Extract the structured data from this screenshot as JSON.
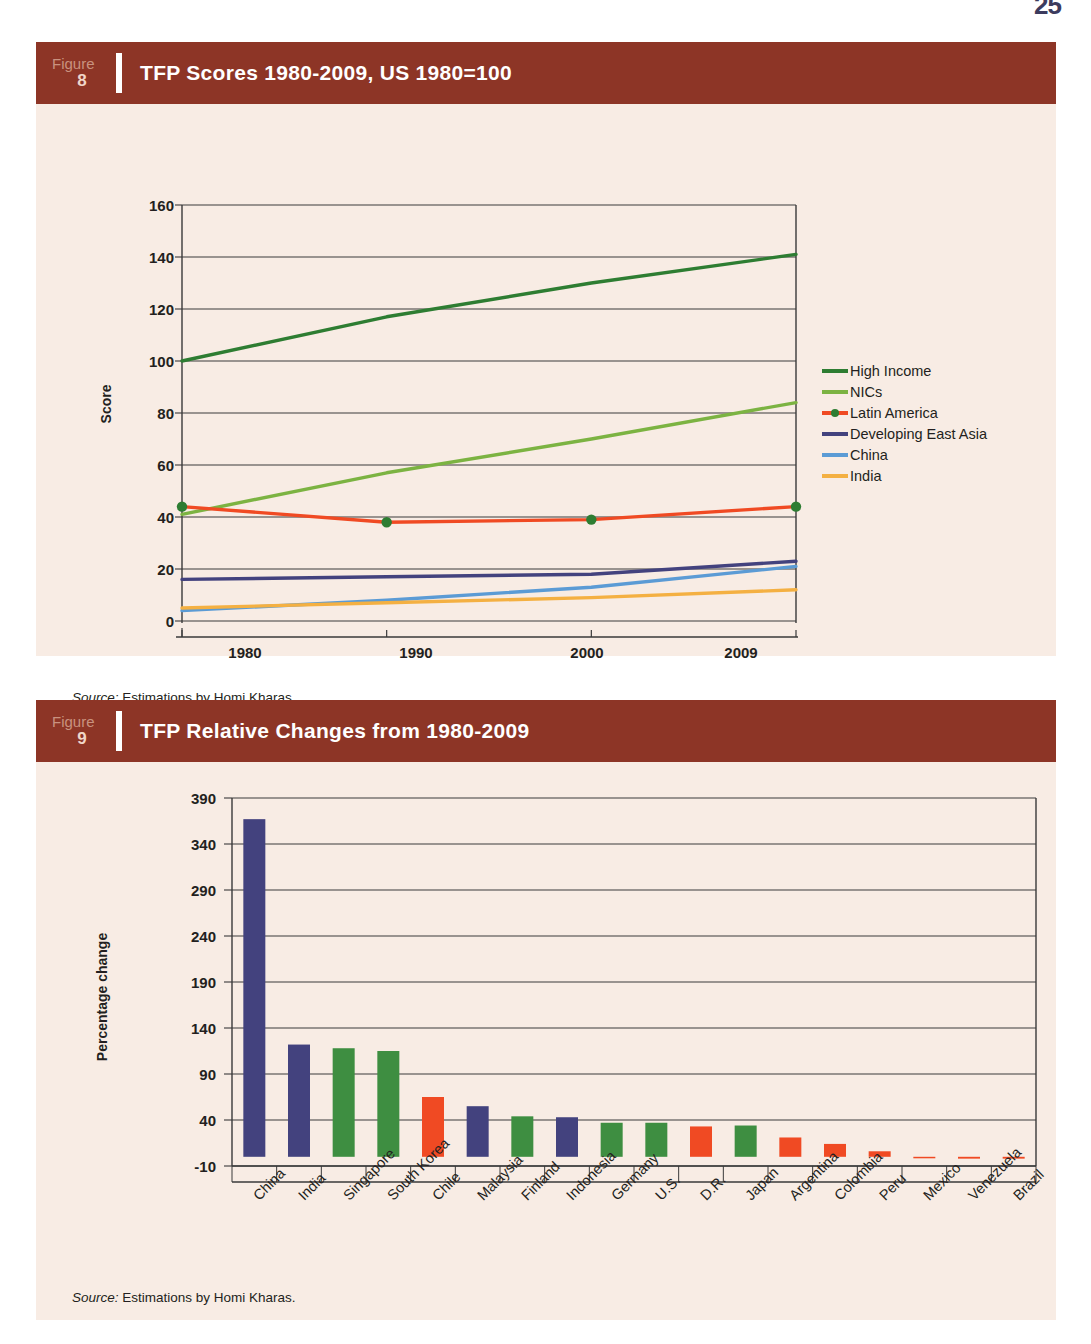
{
  "page": {
    "number": "25"
  },
  "figures": [
    {
      "badge_word": "Figure",
      "badge_number": "8",
      "title": "TFP Scores 1980-2009, US 1980=100",
      "source_prefix": "Source:",
      "source_text": " Estimations by Homi Kharas."
    },
    {
      "badge_word": "Figure",
      "badge_number": "9",
      "title": "TFP Relative Changes from 1980-2009",
      "source_prefix": "Source:",
      "source_text": " Estimations by Homi Kharas."
    }
  ],
  "chart_data": [
    {
      "type": "line",
      "title": "TFP Scores 1980-2009, US 1980=100",
      "xlabel": "",
      "ylabel": "Score",
      "x": [
        1980,
        1990,
        2000,
        2009
      ],
      "xticklabels": [
        "1980",
        "1990",
        "2000",
        "2009"
      ],
      "ylim": [
        0,
        160
      ],
      "yticks": [
        0,
        20,
        40,
        60,
        80,
        100,
        120,
        140,
        160
      ],
      "yticklabels": [
        "0",
        "20",
        "40",
        "60",
        "80",
        "100",
        "120",
        "140",
        "160"
      ],
      "grid": true,
      "legend_position": "right",
      "series": [
        {
          "name": "High Income",
          "color": "#2e7d32",
          "values": [
            100,
            117,
            130,
            141
          ],
          "markers": false
        },
        {
          "name": "NICs",
          "color": "#7cb342",
          "values": [
            41,
            57,
            70,
            84
          ],
          "markers": false
        },
        {
          "name": "Latin America",
          "color": "#f04a23",
          "values": [
            44,
            38,
            39,
            44
          ],
          "markers": true,
          "marker_color": "#2e7d32"
        },
        {
          "name": "Developing East Asia",
          "color": "#43427e",
          "values": [
            16,
            17,
            18,
            23
          ],
          "markers": false
        },
        {
          "name": "China",
          "color": "#5b9bd5",
          "values": [
            4,
            8,
            13,
            21
          ],
          "markers": false
        },
        {
          "name": "India",
          "color": "#f4b042",
          "values": [
            5,
            7,
            9,
            12
          ],
          "markers": false
        }
      ]
    },
    {
      "type": "bar",
      "title": "TFP Relative Changes from 1980-2009",
      "xlabel": "",
      "ylabel": "Percentage change",
      "ylim": [
        -10,
        390
      ],
      "yticks": [
        -10,
        40,
        90,
        140,
        190,
        240,
        290,
        340,
        390
      ],
      "yticklabels": [
        "-10",
        "40",
        "90",
        "140",
        "190",
        "240",
        "290",
        "340",
        "390"
      ],
      "grid": true,
      "categories": [
        "China",
        "India",
        "Singapore",
        "South Korea",
        "Chile",
        "Malaysia",
        "Finland",
        "Indonesia",
        "Germany",
        "U.S.",
        "D.R.",
        "Japan",
        "Argentina",
        "Colombia",
        "Peru",
        "Mexico",
        "Venezuela",
        "Brazil"
      ],
      "values": [
        367,
        122,
        118,
        115,
        65,
        55,
        44,
        43,
        37,
        37,
        33,
        34,
        21,
        14,
        6,
        -1,
        -2,
        -2
      ],
      "colors": [
        "#43427e",
        "#43427e",
        "#3e8e41",
        "#3e8e41",
        "#f04a23",
        "#43427e",
        "#3e8e41",
        "#43427e",
        "#3e8e41",
        "#3e8e41",
        "#f04a23",
        "#3e8e41",
        "#f04a23",
        "#f04a23",
        "#f04a23",
        "#f04a23",
        "#f04a23",
        "#f04a23"
      ]
    }
  ],
  "colors": {
    "header_brown": "#8d3526",
    "panel_cream": "#f8ece4",
    "text": "#231f20"
  }
}
